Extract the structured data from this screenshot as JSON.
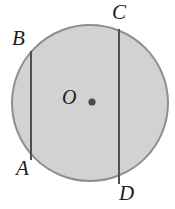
{
  "figure": {
    "kind": "geometry-diagram",
    "background_color": "#ffffff",
    "circle": {
      "name": "circle",
      "center_x": 90,
      "center_y": 103,
      "radius": 78,
      "fill_color": "#d2d2d2",
      "stroke_color": "#8f8f8f",
      "stroke_width": 2
    },
    "center_dot": {
      "name": "center-point-dot",
      "x": 92,
      "y": 102,
      "radius": 3.6,
      "color": "#4a4a4a"
    },
    "chords": [
      {
        "name": "chord-AB",
        "from": "A",
        "to": "B",
        "x1": 31,
        "y1": 160,
        "x2": 31,
        "y2": 51,
        "color": "#4f4f4f",
        "width": 2
      },
      {
        "name": "chord-CD",
        "from": "C",
        "to": "D",
        "x1": 119,
        "y1": 29,
        "x2": 119,
        "y2": 184,
        "color": "#4f4f4f",
        "width": 2
      }
    ],
    "labels": {
      "a": "A",
      "b": "B",
      "c": "C",
      "d": "D",
      "o": "O"
    }
  }
}
